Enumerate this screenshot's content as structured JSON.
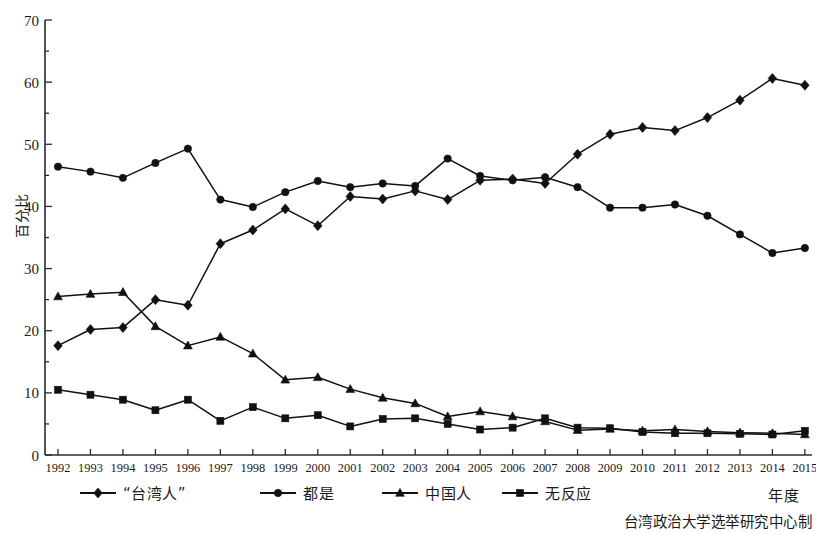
{
  "chart_data": {
    "type": "line",
    "title": "",
    "xlabel": "年度",
    "ylabel": "百分比",
    "xlim": [
      1992,
      2015
    ],
    "ylim": [
      0,
      70
    ],
    "yticks": [
      0,
      10,
      20,
      30,
      40,
      50,
      60,
      70
    ],
    "grid": false,
    "legend_position": "bottom",
    "source_note": "台湾政治大学选举研究中心制",
    "categories": [
      "1992",
      "1993",
      "1994",
      "1995",
      "1996",
      "1997",
      "1998",
      "1999",
      "2000",
      "2001",
      "2002",
      "2003",
      "2004",
      "2005",
      "2006",
      "2007",
      "2008",
      "2009",
      "2010",
      "2011",
      "2012",
      "2013",
      "2014",
      "2015"
    ],
    "series": [
      {
        "name": "“台湾人”",
        "marker": "diamond",
        "values": [
          17.6,
          20.2,
          20.5,
          25.0,
          24.1,
          34.0,
          36.2,
          39.6,
          36.9,
          41.6,
          41.2,
          42.5,
          41.1,
          44.2,
          44.4,
          43.7,
          48.4,
          51.6,
          52.7,
          52.2,
          54.3,
          57.1,
          60.6,
          59.5
        ]
      },
      {
        "name": "都是",
        "marker": "circle",
        "values": [
          46.4,
          45.6,
          44.6,
          47.0,
          49.3,
          41.1,
          39.9,
          42.3,
          44.1,
          43.1,
          43.7,
          43.3,
          47.7,
          44.9,
          44.2,
          44.7,
          43.1,
          39.8,
          39.8,
          40.3,
          38.5,
          35.5,
          32.5,
          33.3
        ]
      },
      {
        "name": "中国人",
        "marker": "triangle",
        "values": [
          25.5,
          25.9,
          26.2,
          20.7,
          17.6,
          19.0,
          16.3,
          12.1,
          12.5,
          10.6,
          9.2,
          8.3,
          6.2,
          7.0,
          6.2,
          5.4,
          4.0,
          4.2,
          3.9,
          4.1,
          3.8,
          3.6,
          3.5,
          3.3
        ]
      },
      {
        "name": "无反应",
        "marker": "square",
        "values": [
          10.5,
          9.7,
          8.9,
          7.2,
          8.9,
          5.5,
          7.7,
          5.9,
          6.4,
          4.6,
          5.8,
          5.9,
          5.0,
          4.1,
          4.4,
          5.9,
          4.4,
          4.3,
          3.7,
          3.5,
          3.5,
          3.4,
          3.3,
          3.9
        ]
      }
    ],
    "colors": {
      "ink": "#111111",
      "axis": "#2b2b2b",
      "background": "#ffffff"
    }
  }
}
